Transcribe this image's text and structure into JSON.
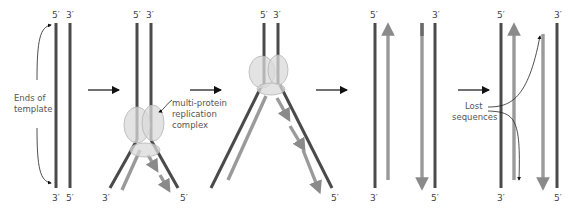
{
  "figure": {
    "labels": {
      "five_prime": "5′",
      "three_prime": "3′",
      "ends_of_template_line1": "Ends of",
      "ends_of_template_line2": "template",
      "complex_line1": "multi-protein",
      "complex_line2": "replication",
      "complex_line3": "complex",
      "lost_line1": "Lost",
      "lost_line2": "sequences"
    },
    "colors": {
      "template_strand": "#4a4a4a",
      "new_strand": "#9a9a9a",
      "complex": "#d9d9d9"
    },
    "panels": [
      {
        "name": "template-ends"
      },
      {
        "name": "replication-start"
      },
      {
        "name": "replication-fork-progressed"
      },
      {
        "name": "replication-complete"
      },
      {
        "name": "lost-sequences"
      }
    ]
  }
}
